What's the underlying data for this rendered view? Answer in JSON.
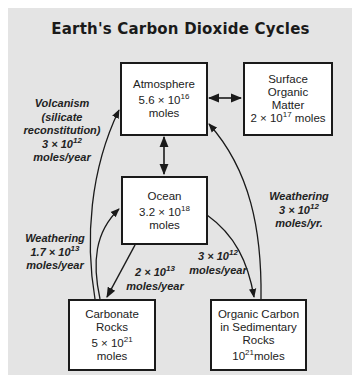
{
  "title": "Earth's Carbon Dioxide Cycles",
  "reservoirs": {
    "atmosphere": {
      "name": "Atmosphere",
      "amount_mantissa": "5.6 ×",
      "amount_base": "10",
      "amount_exp": "16",
      "unit": "moles"
    },
    "surface_organic": {
      "name_lines": [
        "Surface",
        "Organic",
        "Matter"
      ],
      "amount_mantissa": "2 ×",
      "amount_base": "10",
      "amount_exp": "17",
      "unit": "moles"
    },
    "ocean": {
      "name": "Ocean",
      "amount_mantissa": "3.2 ×",
      "amount_base": "10",
      "amount_exp": "18",
      "unit": "moles"
    },
    "carbonate_rocks": {
      "name_lines": [
        "Carbonate",
        "Rocks"
      ],
      "amount_mantissa": "5 ×",
      "amount_base": "10",
      "amount_exp": "21",
      "unit": "moles"
    },
    "organic_carbon": {
      "name_lines": [
        "Organic Carbon",
        "in Sedimentary",
        "Rocks"
      ],
      "amount_base": "10",
      "amount_exp": "21",
      "unit": "moles"
    }
  },
  "fluxes": {
    "volcanism": {
      "head": "Volcanism",
      "sub_lines": [
        "(silicate",
        "reconstitution)"
      ],
      "rate_mantissa": "3 ×",
      "rate_base": "10",
      "rate_exp": "12",
      "unit": "moles/year"
    },
    "weathering_carbonate": {
      "head": "Weathering",
      "rate_mantissa": "1.7 ×",
      "rate_base": "10",
      "rate_exp": "13",
      "unit": "moles/year"
    },
    "ocean_to_carbonate": {
      "rate_mantissa": "2 ×",
      "rate_base": "10",
      "rate_exp": "13",
      "unit": "moles/year"
    },
    "ocean_to_organic": {
      "rate_mantissa": "3 ×",
      "rate_base": "10",
      "rate_exp": "12",
      "unit": "moles/year"
    },
    "weathering_organic": {
      "head": "Weathering",
      "rate_mantissa": "3 ×",
      "rate_base": "10",
      "rate_exp": "12",
      "unit": "moles/yr."
    }
  },
  "colors": {
    "background_panel": "#e4e4e4",
    "box_fill": "#ffffff",
    "stroke": "#1a1a1a"
  }
}
